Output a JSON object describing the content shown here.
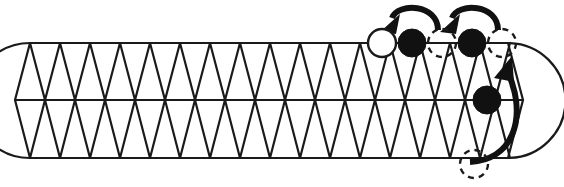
{
  "figure": {
    "background_color": "#ffffff",
    "line_color": "#1a1a1a",
    "fill_color": "#111111",
    "canvas": {
      "width": 564,
      "height": 187
    }
  },
  "lattice": {
    "type": "triangular-strip",
    "rows": 3,
    "row_y": [
      43,
      100,
      158
    ],
    "left_cap_x": 30,
    "right_cap_x": 508,
    "column_spacing": 30,
    "top_row_x": [
      30,
      60,
      90,
      120,
      150,
      180,
      210,
      240,
      270,
      300,
      330,
      360,
      382,
      412,
      442,
      472,
      502
    ],
    "mid_row_x": [
      15,
      45,
      75,
      105,
      135,
      165,
      195,
      225,
      255,
      285,
      315,
      345,
      375,
      397,
      427,
      457,
      487,
      517
    ],
    "bottom_row_x": [
      30,
      60,
      90,
      120,
      150,
      180,
      210,
      240,
      270,
      300,
      330,
      360,
      382,
      412,
      442,
      472,
      502
    ],
    "stroke_width": 2.2,
    "cap_stroke_width": 2.2
  },
  "particles": [
    {
      "label": "open-site",
      "style": "open",
      "cx": 382,
      "cy": 43,
      "r": 14
    },
    {
      "label": "occupied-site-1",
      "style": "filled",
      "cx": 412,
      "cy": 43,
      "r": 14
    },
    {
      "label": "vacated-site-1",
      "style": "dashed",
      "cx": 442,
      "cy": 43,
      "r": 14
    },
    {
      "label": "occupied-site-2",
      "style": "filled",
      "cx": 472,
      "cy": 43,
      "r": 14
    },
    {
      "label": "vacated-site-2",
      "style": "dashed",
      "cx": 502,
      "cy": 43,
      "r": 14
    },
    {
      "label": "occupied-site-3",
      "style": "filled",
      "cx": 487,
      "cy": 100,
      "r": 14
    },
    {
      "label": "vacated-site-3",
      "style": "dashed",
      "cx": 474,
      "cy": 164,
      "r": 14
    }
  ],
  "arrows": [
    {
      "label": "hop-arrow-left-1",
      "direction": "leftward-arc",
      "from": [
        438,
        30
      ],
      "to": [
        390,
        30
      ]
    },
    {
      "label": "hop-arrow-left-2",
      "direction": "leftward-arc",
      "from": [
        498,
        30
      ],
      "to": [
        450,
        30
      ]
    },
    {
      "label": "hop-arrow-up-right",
      "direction": "upward-arc",
      "from": [
        472,
        160
      ],
      "to": [
        508,
        62
      ]
    }
  ],
  "legend": {
    "open_circle": "empty site",
    "filled_circle": "occupied site",
    "dashed_circle": "previous position",
    "arrow": "hop direction"
  }
}
